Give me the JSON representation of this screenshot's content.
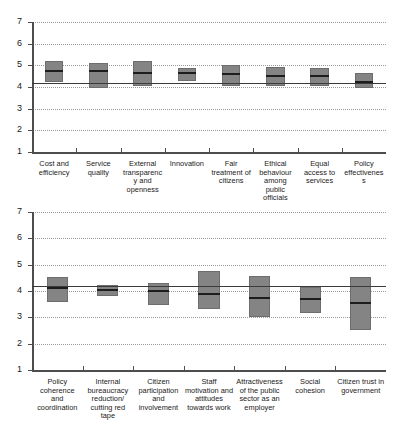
{
  "chart_data": [
    {
      "id": "panel-top",
      "type": "bar",
      "title": "",
      "xlabel": "",
      "ylabel": "",
      "ylim": [
        1,
        7
      ],
      "yticks": [
        1,
        2,
        3,
        4,
        5,
        6,
        7
      ],
      "ytick_labels": [
        "1",
        "2",
        "3",
        "4",
        "5",
        "6",
        "7"
      ],
      "grid": true,
      "legend": "none",
      "reference_line": 4.2,
      "categories": [
        "Cost and efficiency",
        "Service quality",
        "External transparency and openness",
        "Innovation",
        "Fair treatment of citizens",
        "Ethical behaviour among public officials",
        "Equal access to services",
        "Policy effectiveness"
      ],
      "series": [
        {
          "name": "box_low",
          "values": [
            4.25,
            3.95,
            4.05,
            4.3,
            4.05,
            4.05,
            4.05,
            3.95
          ]
        },
        {
          "name": "median",
          "values": [
            4.73,
            4.75,
            4.65,
            4.63,
            4.6,
            4.52,
            4.5,
            4.22
          ]
        },
        {
          "name": "box_high",
          "values": [
            5.18,
            5.1,
            5.2,
            4.9,
            5.0,
            4.93,
            4.9,
            4.65
          ]
        }
      ]
    },
    {
      "id": "panel-bottom",
      "type": "bar",
      "title": "",
      "xlabel": "",
      "ylabel": "",
      "ylim": [
        1,
        7
      ],
      "yticks": [
        1,
        2,
        3,
        4,
        5,
        6,
        7
      ],
      "ytick_labels": [
        "1",
        "2",
        "3",
        "4",
        "5",
        "6",
        "7"
      ],
      "grid": true,
      "legend": "none",
      "reference_line": 4.2,
      "categories": [
        "Policy coherence and coordination",
        "Internal bureaucracy reduction/ cutting red tape",
        "Citizen participation and involvement",
        "Staff motivation and attitudes towards work",
        "Attractiveness of the public sector as an employer",
        "Social cohesion",
        "Citizen trust in government"
      ],
      "series": [
        {
          "name": "box_low",
          "values": [
            3.57,
            3.8,
            3.47,
            3.33,
            3.0,
            3.15,
            2.5
          ]
        },
        {
          "name": "median",
          "values": [
            4.1,
            4.05,
            4.0,
            3.88,
            3.73,
            3.7,
            3.53
          ]
        },
        {
          "name": "box_high",
          "values": [
            4.52,
            4.23,
            4.3,
            4.75,
            4.57,
            4.15,
            4.55
          ]
        }
      ]
    }
  ]
}
